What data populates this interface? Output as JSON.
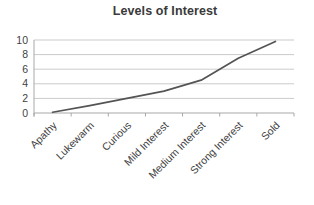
{
  "chart_data": {
    "type": "line",
    "title": "Levels of Interest",
    "categories": [
      "Apathy",
      "Lukewarm",
      "Curious",
      "Mild Interest",
      "Medium Interest",
      "Strong Interest",
      "Sold"
    ],
    "values": [
      0.1,
      1,
      2,
      3,
      4.5,
      7.5,
      9.8
    ],
    "series": [
      {
        "name": "Levels of Interest",
        "values": [
          0.1,
          1,
          2,
          3,
          4.5,
          7.5,
          9.8
        ]
      }
    ],
    "xlabel": "",
    "ylabel": "",
    "ylim": [
      0,
      10
    ],
    "yticks": [
      0,
      2,
      4,
      6,
      8,
      10
    ],
    "grid": true,
    "legend": false,
    "x_label_rotation_deg": -45,
    "colors": {
      "line": "#545454",
      "grid": "#cbcbcb",
      "axis": "#a8a8a8",
      "tick_text": "#3f3f3f",
      "title_text": "#3a3a3a",
      "background": "#ffffff"
    }
  }
}
